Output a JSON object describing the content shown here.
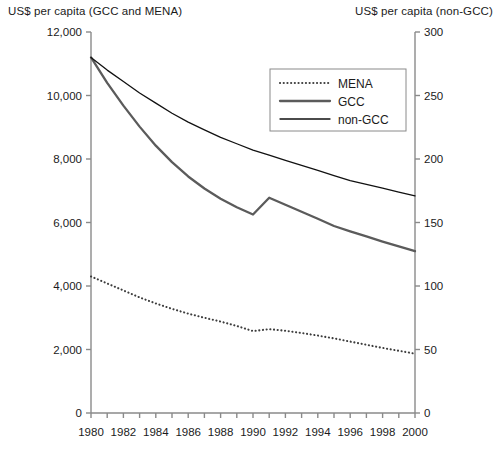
{
  "axis_titles": {
    "left": "US$ per capita (GCC and MENA)",
    "right": "US$ per capita (non-GCC)"
  },
  "legend": {
    "items": [
      {
        "label": "MENA",
        "style": "dotted",
        "color": "#3d3d3d"
      },
      {
        "label": "GCC",
        "style": "solid-thick",
        "color": "#5b5b5b"
      },
      {
        "label": "non-GCC",
        "style": "solid-thin",
        "color": "#111111"
      }
    ]
  },
  "axes": {
    "left_ticks": [
      "0",
      "2,000",
      "4,000",
      "6,000",
      "8,000",
      "10,000",
      "12,000"
    ],
    "right_ticks": [
      "0",
      "50",
      "100",
      "150",
      "200",
      "250",
      "300"
    ],
    "x_ticks": [
      "1980",
      "1982",
      "1984",
      "1986",
      "1988",
      "1990",
      "1992",
      "1994",
      "1996",
      "1998",
      "2000"
    ]
  },
  "chart_data": {
    "type": "line",
    "title": "",
    "xlabel": "",
    "ylabel": "US$ per capita (GCC and MENA)",
    "y2label": "US$ per capita (non-GCC)",
    "xlim": [
      1980,
      2000
    ],
    "ylim": [
      0,
      12000
    ],
    "y2lim": [
      0,
      300
    ],
    "grid": false,
    "legend_position": "top-right",
    "x": [
      1980,
      1981,
      1982,
      1983,
      1984,
      1985,
      1986,
      1987,
      1988,
      1989,
      1990,
      1991,
      1992,
      1993,
      1994,
      1995,
      1996,
      1997,
      1998,
      1999,
      2000
    ],
    "series": [
      {
        "name": "MENA",
        "axis": "left",
        "style": "dotted",
        "color": "#3d3d3d",
        "values": [
          4300,
          4080,
          3860,
          3640,
          3450,
          3280,
          3130,
          3000,
          2880,
          2740,
          2580,
          2640,
          2590,
          2520,
          2440,
          2350,
          2250,
          2150,
          2050,
          1960,
          1870
        ]
      },
      {
        "name": "GCC",
        "axis": "left",
        "style": "solid-thick",
        "color": "#5b5b5b",
        "values": [
          11200,
          10400,
          9680,
          9020,
          8420,
          7900,
          7450,
          7070,
          6750,
          6480,
          6250,
          6780,
          6560,
          6340,
          6120,
          5890,
          5720,
          5560,
          5400,
          5250,
          5100
        ]
      },
      {
        "name": "non-GCC",
        "axis": "right",
        "style": "solid-thin",
        "color": "#111111",
        "values": [
          280,
          270,
          261,
          252,
          244,
          236,
          229,
          223,
          217,
          212,
          207,
          203,
          199,
          195,
          191,
          187,
          183,
          180,
          177,
          174,
          171
        ]
      }
    ]
  }
}
